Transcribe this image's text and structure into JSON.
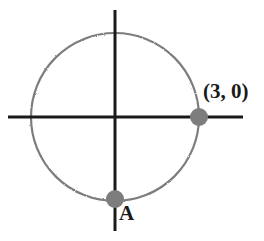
{
  "figure": {
    "background_color": "#ffffff",
    "width": 264,
    "height": 241
  },
  "axes": {
    "x_axis": {
      "name": "x-axis",
      "color": "#1a1a1a",
      "y": 117,
      "x_start": 8,
      "x_end": 243,
      "thickness": 3
    },
    "y_axis": {
      "name": "y-axis",
      "color": "#1a1a1a",
      "x": 115,
      "y_start": 10,
      "y_end": 231,
      "thickness": 3
    },
    "origin": {
      "x": 115,
      "y": 117
    }
  },
  "circle": {
    "name": "circle",
    "center_x": 115,
    "center_y": 117,
    "radius": 84,
    "stroke_color": "#7d7d7d",
    "stroke_width": 2,
    "fill": "none"
  },
  "points": [
    {
      "id": "point-b",
      "label": "(3, 0)",
      "marker_x": 199,
      "marker_y": 117,
      "marker_radius": 9,
      "marker_color": "#7d7d7d",
      "coordinates": {
        "x": 3,
        "y": 0
      }
    },
    {
      "id": "point-a",
      "label": "A",
      "marker_x": 115,
      "marker_y": 199,
      "marker_radius": 9,
      "marker_color": "#7d7d7d",
      "coordinates": {
        "x": 0,
        "y": -3
      }
    }
  ],
  "labels": {
    "point_b_text": "(3, 0)",
    "point_a_text": "A"
  },
  "colors": {
    "axis": "#1a1a1a",
    "curve": "#7d7d7d",
    "marker": "#7d7d7d",
    "text": "#1a1a1a",
    "background": "#ffffff"
  }
}
